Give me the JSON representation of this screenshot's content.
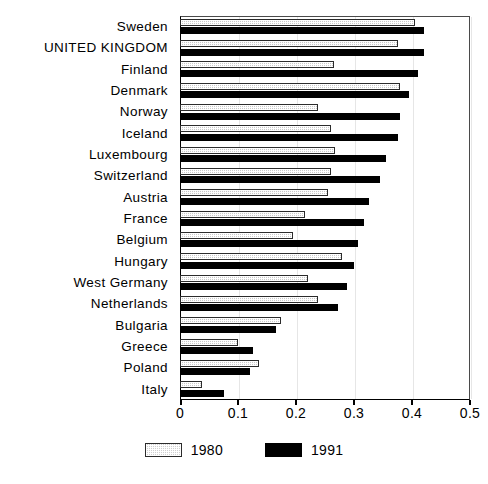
{
  "figure": {
    "title_clipped": "",
    "axis_color": "#000000",
    "frame_color": "#4a4a4a"
  },
  "legend": {
    "position": "bottom-center",
    "items": [
      {
        "label": "1980",
        "swatch": "hatched-light-gray",
        "color": "#c9c9c9"
      },
      {
        "label": "1991",
        "swatch": "solid-black",
        "color": "#000000"
      }
    ]
  },
  "xaxis": {
    "ticks": [
      "0",
      "0.1",
      "0.2",
      "0.3",
      "0.4",
      "0.5"
    ],
    "tick_values": [
      0,
      0.1,
      0.2,
      0.3,
      0.4,
      0.5
    ],
    "min": 0,
    "max": 0.5
  },
  "chart_data": {
    "type": "bar",
    "orientation": "horizontal",
    "title": "",
    "subtitle": "",
    "xlabel": "",
    "ylabel": "",
    "xlim": [
      0,
      0.5
    ],
    "grid": false,
    "legend_position": "bottom",
    "categories": [
      "Sweden",
      "UNITED KINGDOM",
      "Finland",
      "Denmark",
      "Norway",
      "Iceland",
      "Luxembourg",
      "Switzerland",
      "Austria",
      "France",
      "Belgium",
      "Hungary",
      "West Germany",
      "Netherlands",
      "Bulgaria",
      "Greece",
      "Poland",
      "Italy"
    ],
    "series": [
      {
        "name": "1980",
        "color": "#c9c9c9",
        "values": [
          0.405,
          0.376,
          0.266,
          0.38,
          0.238,
          0.26,
          0.267,
          0.26,
          0.255,
          0.215,
          0.194,
          0.28,
          0.22,
          0.238,
          0.174,
          0.1,
          0.136,
          0.038
        ]
      },
      {
        "name": "1991",
        "color": "#000000",
        "values": [
          0.42,
          0.42,
          0.41,
          0.395,
          0.38,
          0.375,
          0.355,
          0.345,
          0.325,
          0.318,
          0.307,
          0.3,
          0.288,
          0.272,
          0.165,
          0.126,
          0.121,
          0.076
        ]
      }
    ]
  }
}
